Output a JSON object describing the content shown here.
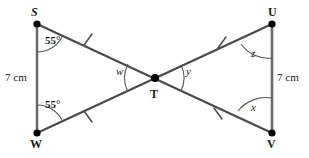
{
  "figure": {
    "type": "geometry-diagram",
    "vertices": [
      {
        "name": "S",
        "x": 37,
        "y": 24,
        "label": "S",
        "label_pos": "above-left"
      },
      {
        "name": "W",
        "x": 37,
        "y": 133,
        "label": "W",
        "label_pos": "below-left"
      },
      {
        "name": "U",
        "x": 272,
        "y": 24,
        "label": "U",
        "label_pos": "above-right"
      },
      {
        "name": "V",
        "x": 272,
        "y": 133,
        "label": "V",
        "label_pos": "below-right"
      },
      {
        "name": "T",
        "x": 155,
        "y": 78,
        "label": "T",
        "label_pos": "below"
      }
    ],
    "segments": [
      {
        "from": "S",
        "to": "W",
        "style": "vertical"
      },
      {
        "from": "U",
        "to": "V",
        "style": "vertical"
      },
      {
        "from": "S",
        "to": "V",
        "style": "diagonal"
      },
      {
        "from": "W",
        "to": "U",
        "style": "diagonal"
      }
    ],
    "tick_marks": [
      {
        "on": "S-T",
        "x": 88,
        "y": 40,
        "count": 1
      },
      {
        "on": "W-T",
        "x": 88,
        "y": 116,
        "count": 1
      },
      {
        "on": "T-U",
        "x": 222,
        "y": 43,
        "count": 1
      },
      {
        "on": "T-V",
        "x": 218,
        "y": 113,
        "count": 1
      }
    ],
    "angle_labels": [
      {
        "at": "S",
        "text": "55°",
        "kind": "measure",
        "x": 50,
        "y": 40
      },
      {
        "at": "W",
        "text": "55°",
        "kind": "measure",
        "x": 50,
        "y": 103
      },
      {
        "at": "T",
        "text": "w",
        "kind": "variable",
        "x": 119,
        "y": 70
      },
      {
        "at": "T",
        "text": "y",
        "kind": "variable",
        "x": 182,
        "y": 70
      },
      {
        "at": "U",
        "text": "z",
        "kind": "variable",
        "x": 250,
        "y": 50
      },
      {
        "at": "V",
        "text": "x",
        "kind": "variable",
        "x": 250,
        "y": 106
      }
    ],
    "side_labels": [
      {
        "on": "S-W",
        "text": "7 cm",
        "x": 6,
        "y": 72
      },
      {
        "on": "U-V",
        "text": "7 cm",
        "x": 277,
        "y": 72
      }
    ],
    "colors": {
      "background": "#ffffff",
      "stroke": "#4a4a4a",
      "vertical_stroke": "#6b6b6b",
      "arc": "#555555",
      "text": "#1a1a1a"
    }
  }
}
